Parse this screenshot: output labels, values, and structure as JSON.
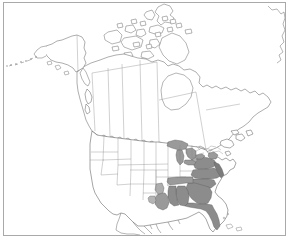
{
  "figure": {
    "kind": "distribution-map",
    "title": "North America distribution map",
    "region_label": "North America",
    "frame_color": "#a9a9a9",
    "background_color": "#ffffff"
  },
  "map": {
    "projection_label": "Lambert conformal conic",
    "outline_color": "#555555",
    "boundary_color": "#8a8a8a",
    "water_color": "#9a9a9a",
    "range_fill_color": "#8c8c8c",
    "range_fill_secondary_color": "#a8a8a8",
    "unshaded_fill_color": "#ffffff",
    "legend": {
      "shown": false,
      "shaded_meaning": "present",
      "unshaded_meaning": "absent"
    },
    "countries": [
      {
        "name": "Canada",
        "shaded": false
      },
      {
        "name": "United States",
        "shaded": true
      },
      {
        "name": "Mexico",
        "shaded": false
      },
      {
        "name": "Greenland",
        "shaded": false
      }
    ],
    "water_bodies": [
      {
        "name": "Lake Superior"
      },
      {
        "name": "Lake Michigan"
      },
      {
        "name": "Lake Huron"
      },
      {
        "name": "Lake Erie"
      },
      {
        "name": "Lake Ontario"
      }
    ],
    "shaded_states": [
      {
        "code": "VA",
        "name": "Virginia",
        "intensity": "dark"
      },
      {
        "code": "NC",
        "name": "North Carolina",
        "intensity": "dark"
      },
      {
        "code": "SC",
        "name": "South Carolina",
        "intensity": "dark"
      },
      {
        "code": "GA",
        "name": "Georgia",
        "intensity": "dark"
      },
      {
        "code": "FL",
        "name": "Florida",
        "intensity": "dark"
      },
      {
        "code": "AL",
        "name": "Alabama",
        "intensity": "dark"
      },
      {
        "code": "MS",
        "name": "Mississippi",
        "intensity": "dark"
      },
      {
        "code": "TN",
        "name": "Tennessee",
        "intensity": "medium"
      },
      {
        "code": "LA",
        "name": "Louisiana",
        "intensity": "medium"
      },
      {
        "code": "AR",
        "name": "Arkansas",
        "intensity": "light"
      },
      {
        "code": "MD",
        "name": "Maryland",
        "intensity": "medium"
      },
      {
        "code": "DE",
        "name": "Delaware",
        "intensity": "medium"
      },
      {
        "code": "WV",
        "name": "West Virginia",
        "intensity": "light"
      },
      {
        "code": "TX",
        "name": "Texas (east)",
        "intensity": "light"
      }
    ],
    "unshaded_states": [
      {
        "code": "WA",
        "name": "Washington"
      },
      {
        "code": "OR",
        "name": "Oregon"
      },
      {
        "code": "CA",
        "name": "California"
      },
      {
        "code": "NV",
        "name": "Nevada"
      },
      {
        "code": "ID",
        "name": "Idaho"
      },
      {
        "code": "MT",
        "name": "Montana"
      },
      {
        "code": "WY",
        "name": "Wyoming"
      },
      {
        "code": "UT",
        "name": "Utah"
      },
      {
        "code": "AZ",
        "name": "Arizona"
      },
      {
        "code": "NM",
        "name": "New Mexico"
      },
      {
        "code": "CO",
        "name": "Colorado"
      },
      {
        "code": "ND",
        "name": "North Dakota"
      },
      {
        "code": "SD",
        "name": "South Dakota"
      },
      {
        "code": "NE",
        "name": "Nebraska"
      },
      {
        "code": "KS",
        "name": "Kansas"
      },
      {
        "code": "OK",
        "name": "Oklahoma"
      },
      {
        "code": "MN",
        "name": "Minnesota"
      },
      {
        "code": "IA",
        "name": "Iowa"
      },
      {
        "code": "MO",
        "name": "Missouri"
      },
      {
        "code": "WI",
        "name": "Wisconsin"
      },
      {
        "code": "IL",
        "name": "Illinois"
      },
      {
        "code": "MI",
        "name": "Michigan"
      },
      {
        "code": "IN",
        "name": "Indiana"
      },
      {
        "code": "OH",
        "name": "Ohio"
      },
      {
        "code": "KY",
        "name": "Kentucky"
      },
      {
        "code": "PA",
        "name": "Pennsylvania"
      },
      {
        "code": "NY",
        "name": "New York"
      },
      {
        "code": "NJ",
        "name": "New Jersey"
      },
      {
        "code": "CT",
        "name": "Connecticut"
      },
      {
        "code": "RI",
        "name": "Rhode Island"
      },
      {
        "code": "MA",
        "name": "Massachusetts"
      },
      {
        "code": "VT",
        "name": "Vermont"
      },
      {
        "code": "NH",
        "name": "New Hampshire"
      },
      {
        "code": "ME",
        "name": "Maine"
      },
      {
        "code": "AK",
        "name": "Alaska"
      }
    ],
    "canadian_provinces": [
      {
        "code": "YT",
        "name": "Yukon"
      },
      {
        "code": "NT",
        "name": "Northwest Territories"
      },
      {
        "code": "NU",
        "name": "Nunavut"
      },
      {
        "code": "BC",
        "name": "British Columbia"
      },
      {
        "code": "AB",
        "name": "Alberta"
      },
      {
        "code": "SK",
        "name": "Saskatchewan"
      },
      {
        "code": "MB",
        "name": "Manitoba"
      },
      {
        "code": "ON",
        "name": "Ontario"
      },
      {
        "code": "QC",
        "name": "Quebec"
      },
      {
        "code": "NL",
        "name": "Newfoundland and Labrador"
      },
      {
        "code": "NB",
        "name": "New Brunswick"
      },
      {
        "code": "NS",
        "name": "Nova Scotia"
      },
      {
        "code": "PE",
        "name": "Prince Edward Island"
      }
    ]
  }
}
